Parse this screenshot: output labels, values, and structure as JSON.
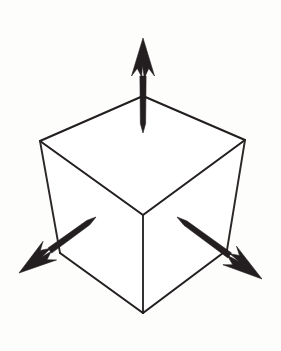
{
  "figure": {
    "title": "Cube with three orthogonal direction arrows",
    "background_color": "#fdfdfc",
    "line_color": "#231f20",
    "arrow_color": "#231f20",
    "canvas": {
      "width": 281,
      "height": 351
    }
  },
  "cube": {
    "name": "wireframe-cube",
    "vertices": {
      "top_back": {
        "x": 143,
        "y": 96
      },
      "top_left": {
        "x": 40,
        "y": 141
      },
      "top_right": {
        "x": 245,
        "y": 140
      },
      "center_front": {
        "x": 143,
        "y": 215
      },
      "bottom_left": {
        "x": 60,
        "y": 253
      },
      "bottom_right": {
        "x": 227,
        "y": 250
      },
      "bottom_front": {
        "x": 143,
        "y": 313
      }
    },
    "edges": [
      {
        "name": "top-back-left",
        "from": "top_back",
        "to": "top_left"
      },
      {
        "name": "top-back-right",
        "from": "top_back",
        "to": "top_right"
      },
      {
        "name": "top-front-left",
        "from": "top_left",
        "to": "center_front"
      },
      {
        "name": "top-front-right",
        "from": "top_right",
        "to": "center_front"
      },
      {
        "name": "vertical-left",
        "from": "top_left",
        "to": "bottom_left"
      },
      {
        "name": "vertical-right",
        "from": "top_right",
        "to": "bottom_right"
      },
      {
        "name": "vertical-center",
        "from": "center_front",
        "to": "bottom_front"
      },
      {
        "name": "bottom-left",
        "from": "bottom_left",
        "to": "bottom_front"
      },
      {
        "name": "bottom-right",
        "from": "bottom_right",
        "to": "bottom_front"
      }
    ],
    "edge_count": 9,
    "stroke_width": 2.1
  },
  "arrows": [
    {
      "id": "arrow-up",
      "label": "vertical up arrow",
      "direction": "up",
      "tail": {
        "x": 143,
        "y": 133
      },
      "tip": {
        "x": 143,
        "y": 38
      },
      "angle_deg": 90,
      "length_px": 95
    },
    {
      "id": "arrow-down-left",
      "label": "down-left arrow",
      "direction": "down-left",
      "tail": {
        "x": 96,
        "y": 217
      },
      "tip": {
        "x": 19,
        "y": 273
      },
      "angle_deg": 215,
      "length_px": 95
    },
    {
      "id": "arrow-down-right",
      "label": "down-right arrow",
      "direction": "down-right",
      "tail": {
        "x": 177,
        "y": 217
      },
      "tip": {
        "x": 262,
        "y": 279
      },
      "angle_deg": 324,
      "length_px": 105
    }
  ]
}
